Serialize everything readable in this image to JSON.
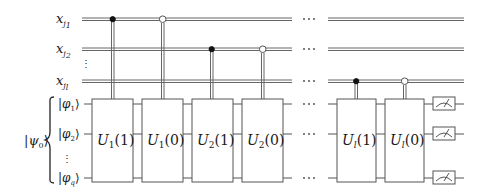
{
  "diagram": {
    "type": "quantum-circuit",
    "classical_registers": [
      {
        "id": "x_j1",
        "label": "x",
        "subscript": "j",
        "subsub": "1",
        "y": 19
      },
      {
        "id": "x_j2",
        "label": "x",
        "subscript": "j",
        "subsub": "2",
        "y": 49
      },
      {
        "id": "x_jl",
        "label": "x",
        "subscript": "j",
        "subsub": "l",
        "y": 81
      }
    ],
    "quantum_register_label": "|ψ₀⟩",
    "quantum_wires": [
      {
        "id": "phi_1",
        "label": "|φ₁⟩",
        "y": 104
      },
      {
        "id": "phi_2",
        "label": "|φ₂⟩",
        "y": 134
      },
      {
        "id": "phi_q",
        "label": "|φq⟩",
        "y": 178
      }
    ],
    "vertical_ellipsis": "⋮",
    "horizontal_ellipsis": "···",
    "gates": [
      {
        "id": "U1_1",
        "label": "U",
        "sub": "1",
        "arg": "(1)",
        "x": 92,
        "w": 41,
        "control": "x_j1",
        "control_type": "filled"
      },
      {
        "id": "U1_0",
        "label": "U",
        "sub": "1",
        "arg": "(0)",
        "x": 142,
        "w": 41,
        "control": "x_j1",
        "control_type": "open"
      },
      {
        "id": "U2_1",
        "label": "U",
        "sub": "2",
        "arg": "(1)",
        "x": 192,
        "w": 41,
        "control": "x_j2",
        "control_type": "filled"
      },
      {
        "id": "U2_0",
        "label": "U",
        "sub": "2",
        "arg": "(0)",
        "x": 242,
        "w": 41,
        "control": "x_j2",
        "control_type": "open"
      },
      {
        "id": "Ul_1",
        "label": "U",
        "sub": "l",
        "arg": "(1)",
        "x": 337,
        "w": 39,
        "control": "x_jl",
        "control_type": "filled"
      },
      {
        "id": "Ul_0",
        "label": "U",
        "sub": "l",
        "arg": "(0)",
        "x": 385,
        "w": 39,
        "control": "x_jl",
        "control_type": "open"
      }
    ],
    "measurements": [
      {
        "wire": "phi_1"
      },
      {
        "wire": "phi_2"
      },
      {
        "wire": "phi_q"
      }
    ]
  }
}
